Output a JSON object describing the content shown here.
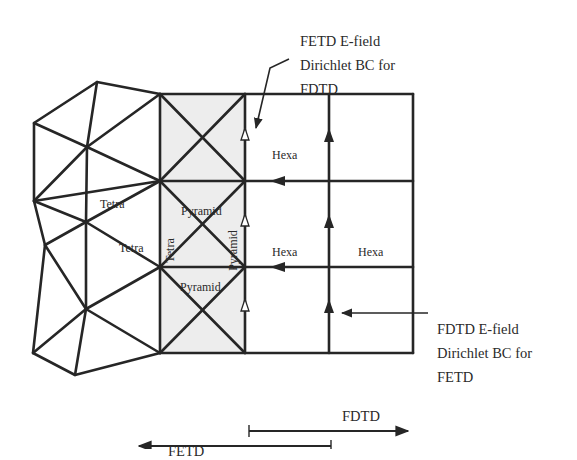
{
  "labels": {
    "tetra_1": "Tetra",
    "tetra_2": "Tetra",
    "tetra_vertical": "Tetra",
    "pyramid_top": "Pyramid",
    "pyramid_bottom": "Pyramid",
    "pyramid_vertical": "Pyramid",
    "hexa_top": "Hexa",
    "hexa_middle_left": "Hexa",
    "hexa_middle_right": "Hexa"
  },
  "annotations": {
    "fetd_bc": {
      "line1": "FETD E-field",
      "line2": "Dirichlet BC for",
      "line3": "FDTD"
    },
    "fdtd_bc": {
      "line1": "FDTD E-field",
      "line2": "Dirichlet BC for",
      "line3": "FETD"
    }
  },
  "extents": {
    "fdtd": "FDTD",
    "fetd": "FETD"
  },
  "colors": {
    "line": "#262626",
    "transition_fill": "#ededed",
    "background": "#ffffff"
  }
}
